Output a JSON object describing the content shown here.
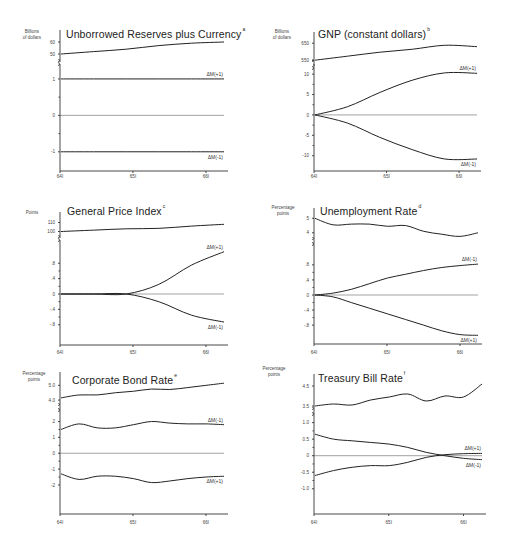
{
  "figure": {
    "panels": [
      {
        "id": "unborrowed-reserves",
        "title": "Unborrowed Reserves plus Currency",
        "footnote": "a",
        "unit_line1": "Billions",
        "unit_line2": "of dollars",
        "top_ticks": [
          "60",
          "50"
        ],
        "bottom_ticks": [
          "1",
          "0",
          "-1"
        ],
        "x_ticks": [
          "64I",
          "65I",
          "66I"
        ],
        "labels": {
          "plus": "ΔM(+1)",
          "minus": "ΔM(-1)"
        }
      },
      {
        "id": "gnp",
        "title": "GNP (constant dollars)",
        "footnote": "b",
        "unit_line1": "Billions",
        "unit_line2": "of dollars",
        "top_ticks": [
          "650",
          "550"
        ],
        "bottom_ticks": [
          "10",
          "5",
          "0",
          "-5",
          "-10"
        ],
        "x_ticks": [
          "64I",
          "65I",
          "66I"
        ],
        "labels": {
          "plus": "ΔM(+1)",
          "minus": "ΔM(-1)"
        }
      },
      {
        "id": "general-price-index",
        "title": "General Price Index",
        "footnote": "c",
        "unit_line1": "Points",
        "unit_line2": "",
        "top_ticks": [
          "110",
          "100"
        ],
        "bottom_ticks": [
          ".8",
          ".4",
          "0",
          "-.4",
          "-.8"
        ],
        "x_ticks": [
          "64I",
          "65I",
          "66I"
        ],
        "labels": {
          "plus": "ΔM(+1)",
          "minus": "ΔM(-1)"
        }
      },
      {
        "id": "unemployment-rate",
        "title": "Unemployment Rate",
        "footnote": "d",
        "unit_line1": "Percentage",
        "unit_line2": "points",
        "top_ticks": [
          "5",
          "4"
        ],
        "bottom_ticks": [
          ".8",
          ".4",
          "0",
          "-.4",
          "-.8"
        ],
        "x_ticks": [
          "64I",
          "65I",
          "66I"
        ],
        "labels": {
          "plus": "ΔM(-1)",
          "minus": "ΔM(+1)"
        }
      },
      {
        "id": "corporate-bond-rate",
        "title": "Corporate Bond Rate",
        "footnote": "e",
        "unit_line1": "Percentage",
        "unit_line2": "points",
        "top_ticks": [
          "5.0",
          "4.0"
        ],
        "bottom_ticks": [
          "2",
          "1",
          "0",
          "-1",
          "-2"
        ],
        "x_ticks": [
          "64I",
          "65I",
          "66I"
        ],
        "labels": {
          "plus": "ΔM(-1)",
          "minus": "ΔM(+1)"
        }
      },
      {
        "id": "treasury-bill-rate",
        "title": "Treasury Bill Rate",
        "footnote": "f",
        "unit_line1": "Percentage",
        "unit_line2": "points",
        "top_ticks": [
          "4.5",
          "3.5"
        ],
        "bottom_ticks": [
          "1.0",
          "0.5",
          "0",
          "-0.5",
          "-1.0"
        ],
        "x_ticks": [
          "64I",
          "65I",
          "66I"
        ],
        "labels": {
          "plus": "ΔM(+1)",
          "minus": "ΔM(-1)"
        }
      }
    ]
  },
  "chart_data": [
    {
      "type": "line",
      "title": "Unborrowed Reserves plus Currency",
      "ylabel": "Billions of dollars",
      "x": [
        "64I",
        "64III",
        "65I",
        "65III",
        "66I",
        "66II"
      ],
      "top_series": {
        "name": "Level",
        "ylim": [
          45,
          65
        ],
        "ticks": [
          50,
          60
        ],
        "values": [
          50,
          52,
          54,
          57,
          59,
          60
        ]
      },
      "series": [
        {
          "name": "ΔM(+1)",
          "values": [
            1,
            1,
            1,
            1,
            1,
            1
          ]
        },
        {
          "name": "ΔM(-1)",
          "values": [
            -1,
            -1,
            -1,
            -1,
            -1,
            -1
          ]
        }
      ],
      "ylim": [
        -1.5,
        1.3
      ],
      "yticks": [
        1,
        0,
        -1
      ]
    },
    {
      "type": "line",
      "title": "GNP (constant dollars)",
      "ylabel": "Billions of dollars",
      "x": [
        "64I",
        "64III",
        "65I",
        "65III",
        "66I",
        "66II"
      ],
      "top_series": {
        "name": "Level",
        "ylim": [
          530,
          680
        ],
        "ticks": [
          550,
          650
        ],
        "values": [
          552,
          575,
          598,
          615,
          638,
          630
        ]
      },
      "series": [
        {
          "name": "ΔM(+1)",
          "values": [
            0,
            2,
            5.5,
            8.5,
            10.3,
            10.2
          ]
        },
        {
          "name": "ΔM(-1)",
          "values": [
            0,
            -2,
            -5.5,
            -8.5,
            -10.8,
            -10.8
          ]
        }
      ],
      "ylim": [
        -13.5,
        11.5
      ],
      "yticks": [
        10,
        5,
        0,
        -5,
        -10
      ]
    },
    {
      "type": "line",
      "title": "General Price Index",
      "ylabel": "Points",
      "x": [
        "64I",
        "64III",
        "65I",
        "65III",
        "66I",
        "66II"
      ],
      "top_series": {
        "name": "Level",
        "ylim": [
          95,
          115
        ],
        "ticks": [
          100,
          110
        ],
        "values": [
          100,
          101.5,
          103,
          103.5,
          106,
          108
        ]
      },
      "series": [
        {
          "name": "ΔM(+1)",
          "values": [
            0,
            0,
            0,
            0.25,
            0.75,
            1.1
          ]
        },
        {
          "name": "ΔM(-1)",
          "values": [
            0,
            0,
            0,
            -0.2,
            -0.55,
            -0.73
          ]
        }
      ],
      "ylim": [
        -1.3,
        1.3
      ],
      "yticks": [
        0.8,
        0.4,
        0,
        -0.4,
        -0.8
      ]
    },
    {
      "type": "line",
      "title": "Unemployment Rate",
      "ylabel": "Percentage points",
      "x": [
        "64I",
        "64II",
        "64III",
        "64IV",
        "65I",
        "65II",
        "65III",
        "65IV",
        "66I",
        "66II"
      ],
      "top_series": {
        "name": "Level",
        "ylim": [
          3.5,
          5.3
        ],
        "ticks": [
          4,
          5
        ],
        "values": [
          5.0,
          4.55,
          4.6,
          4.6,
          4.45,
          4.5,
          4.1,
          3.9,
          3.75,
          4.0
        ]
      },
      "series": [
        {
          "name": "ΔM(-1)",
          "values": [
            0,
            0.05,
            0.15,
            0.3,
            0.45,
            0.55,
            0.65,
            0.73,
            0.78,
            0.82
          ]
        },
        {
          "name": "ΔM(+1)",
          "values": [
            0,
            -0.05,
            -0.2,
            -0.35,
            -0.5,
            -0.65,
            -0.8,
            -0.95,
            -1.05,
            -1.07
          ]
        }
      ],
      "ylim": [
        -1.3,
        1.3
      ],
      "yticks": [
        0.8,
        0.4,
        0,
        -0.4,
        -0.8
      ]
    },
    {
      "type": "line",
      "title": "Corporate Bond Rate",
      "ylabel": "Percentage points",
      "x": [
        "64I",
        "64II",
        "64III",
        "64IV",
        "65I",
        "65II",
        "65III",
        "65IV",
        "66I",
        "66II"
      ],
      "top_series": {
        "name": "Level",
        "ylim": [
          3.6,
          5.5
        ],
        "ticks": [
          4.0,
          5.0
        ],
        "values": [
          4.15,
          4.35,
          4.35,
          4.5,
          4.6,
          4.75,
          4.72,
          4.85,
          5.0,
          5.15
        ]
      },
      "series": [
        {
          "name": "ΔM(-1)",
          "values": [
            1.5,
            1.85,
            1.6,
            1.6,
            1.8,
            2.0,
            1.9,
            1.85,
            1.85,
            1.8
          ]
        },
        {
          "name": "ΔM(+1)",
          "values": [
            -1.3,
            -1.65,
            -1.45,
            -1.45,
            -1.6,
            -1.85,
            -1.75,
            -1.6,
            -1.5,
            -1.45
          ]
        }
      ],
      "ylim": [
        -3.2,
        2.6
      ],
      "yticks": [
        2,
        1,
        0,
        -1,
        -2
      ]
    },
    {
      "type": "line",
      "title": "Treasury Bill Rate",
      "ylabel": "Percentage points",
      "x": [
        "64I",
        "64II",
        "64III",
        "64IV",
        "65I",
        "65II",
        "65III",
        "65IV",
        "66I",
        "66II"
      ],
      "top_series": {
        "name": "Level",
        "ylim": [
          3.3,
          4.8
        ],
        "ticks": [
          3.5,
          4.5
        ],
        "values": [
          3.5,
          3.6,
          3.55,
          3.8,
          3.95,
          4.1,
          3.75,
          4.0,
          3.95,
          4.6
        ]
      },
      "series": [
        {
          "name": "ΔM(+1)",
          "values": [
            -0.6,
            -0.45,
            -0.35,
            -0.3,
            -0.3,
            -0.2,
            -0.05,
            0.03,
            0.06,
            0.07
          ]
        },
        {
          "name": "ΔM(-1)",
          "values": [
            0.65,
            0.5,
            0.45,
            0.4,
            0.35,
            0.25,
            0.1,
            0.0,
            -0.08,
            -0.12
          ]
        }
      ],
      "ylim": [
        -1.4,
        1.2
      ],
      "yticks": [
        1.0,
        0.5,
        0,
        -0.5,
        -1.0
      ]
    }
  ]
}
